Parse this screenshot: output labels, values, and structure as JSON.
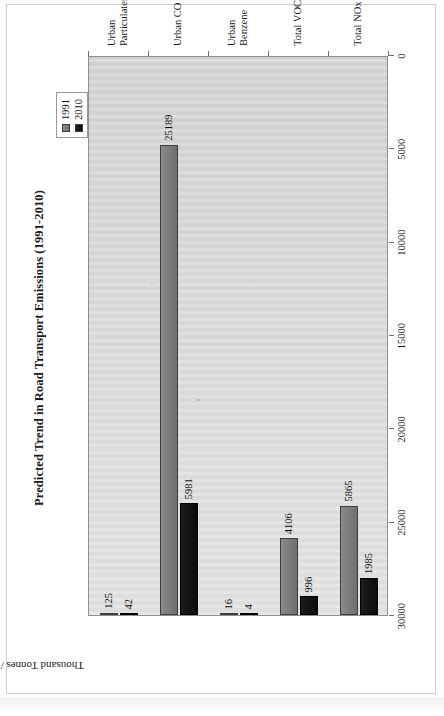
{
  "chart_data": {
    "type": "bar",
    "title": "Predicted Trend in Road Transport Emissions (1991-2010)",
    "xlabel": "",
    "ylabel": "Thousand Tonnes / year",
    "orientation": "rotated-90-ccw",
    "grid": false,
    "legend_position": "top-right",
    "ylim": [
      0,
      30000
    ],
    "yticks": [
      0,
      5000,
      10000,
      15000,
      20000,
      25000,
      30000
    ],
    "ytick_labels": [
      "0",
      "5000",
      "10000",
      "15000",
      "20000",
      "25000",
      "30000"
    ],
    "categories": [
      "Urban\nParticulates",
      "Urban CO",
      "Urban\nBenzene",
      "Total VOCs",
      "Total NOx"
    ],
    "category_labels": [
      {
        "line1": "Urban",
        "line2": "Particulates"
      },
      {
        "line1": "Urban CO",
        "line2": ""
      },
      {
        "line1": "Urban",
        "line2": "Benzene"
      },
      {
        "line1": "Total VOCs",
        "line2": ""
      },
      {
        "line1": "Total NOx",
        "line2": ""
      }
    ],
    "series": [
      {
        "name": "1991",
        "color": "#7f7f7f",
        "values": [
          125,
          25189,
          16,
          4106,
          5865
        ],
        "labels": [
          "125",
          "25189",
          "16",
          "4106",
          "5865"
        ]
      },
      {
        "name": "2010",
        "color": "#000000",
        "values": [
          42,
          5981,
          4,
          996,
          1985
        ],
        "labels": [
          "42",
          "5981",
          "4",
          "996",
          "1985"
        ]
      }
    ],
    "plot_background": "#dadada",
    "annotations": []
  },
  "legend": {
    "items": [
      {
        "label": "1991",
        "swatch": "#7f7f7f"
      },
      {
        "label": "2010",
        "swatch": "#000000"
      }
    ]
  }
}
